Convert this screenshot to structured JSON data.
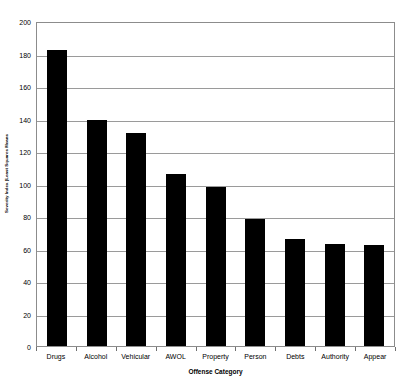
{
  "chart_data": {
    "type": "bar",
    "title": "",
    "xlabel": "Offense Category",
    "ylabel": "Severity Index (Least Squares Means",
    "categories": [
      "Drugs",
      "Alcohol",
      "Vehicular",
      "AWOL",
      "Property",
      "Person",
      "Debts",
      "Authority",
      "Appear"
    ],
    "values": [
      182,
      139,
      131,
      106,
      98,
      78,
      66,
      63,
      62
    ],
    "ylim": [
      0,
      200
    ],
    "ytick_labels": [
      "200",
      "180",
      "160",
      "140",
      "120",
      "100",
      "80",
      "60",
      "40",
      "20",
      "0"
    ],
    "ytick_values": [
      200,
      180,
      160,
      140,
      120,
      100,
      80,
      60,
      40,
      20,
      0
    ],
    "grid": true,
    "legend": "none",
    "bar_color": "#000000",
    "axis_color": "#8c8c8c",
    "grid_color": "#9a9a9a",
    "background_color": "#ffffff"
  }
}
